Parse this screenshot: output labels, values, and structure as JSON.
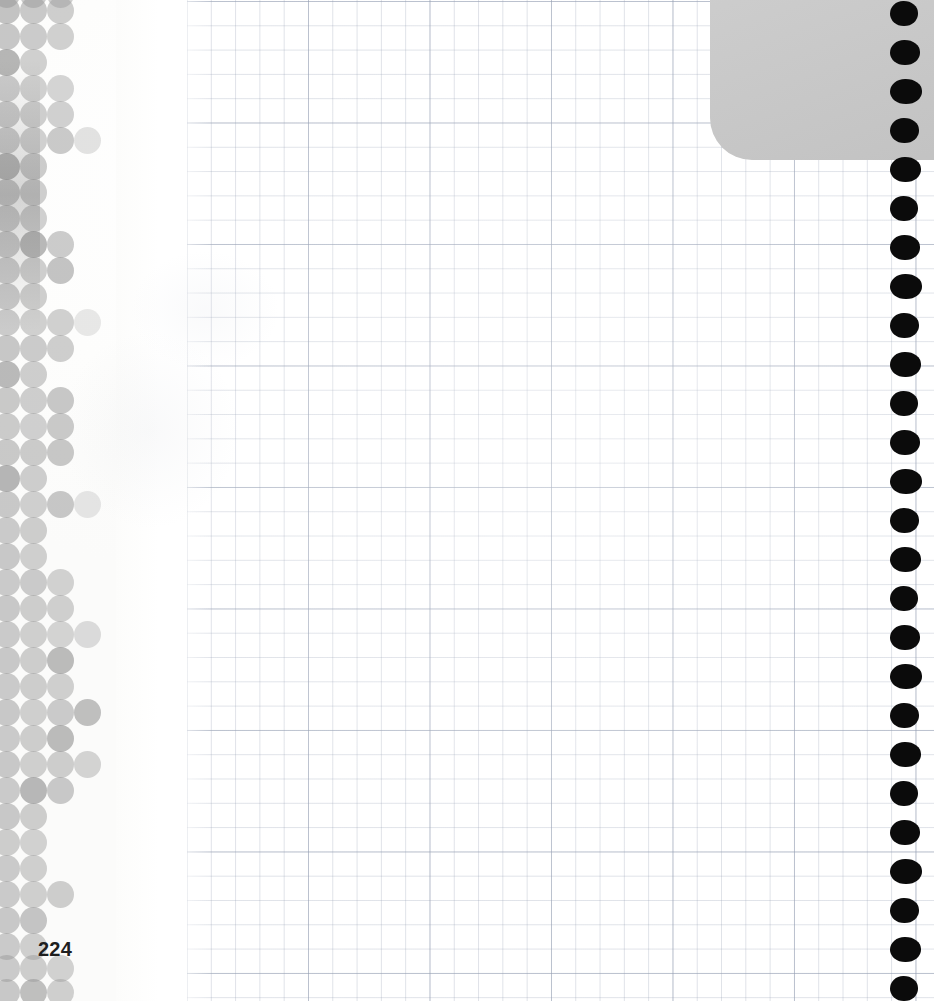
{
  "page": {
    "type": "scanned-book-page",
    "page_number": "224",
    "page_number_color": "#1f1f1f",
    "paper": {
      "kind": "graph-paper",
      "background_color": "#ffffff",
      "minor_grid_color": "#96a0b4",
      "major_grid_color": "#96a0b4",
      "minor_cell_px": 24,
      "major_cell_px": 121,
      "grid_left_px": 186,
      "grid_right_px": 934
    },
    "content_text": ""
  },
  "gray_panel": {
    "label": "top-right gray block",
    "color": "#c9c9c9",
    "left_px": 710,
    "top_px": 0,
    "width_px": 224,
    "height_px": 160,
    "corner_radius_px": 42
  },
  "binding": {
    "label": "right edge binding holes",
    "color": "#0b0b0b",
    "count": 26,
    "first_center_y_px": 14,
    "spacing_px": 39,
    "center_x_px": 905,
    "diameter_px": 28
  },
  "halftone": {
    "label": "left margin halftone dot pattern",
    "base_color": "#9a9a9a",
    "columns_x_px": [
      6,
      33,
      60,
      87,
      113
    ],
    "row_spacing_px": 26,
    "dot_diameter_px": 27,
    "rows": [
      {
        "y": -6,
        "cells": [
          {
            "c": 0,
            "o": 0.55
          },
          {
            "c": 1,
            "o": 0.5
          },
          {
            "c": 2,
            "o": 0.45
          }
        ]
      },
      {
        "y": 10,
        "cells": [
          {
            "c": 0,
            "o": 0.58
          },
          {
            "c": 1,
            "o": 0.52
          },
          {
            "c": 2,
            "o": 0.48
          }
        ]
      },
      {
        "y": 36,
        "cells": [
          {
            "c": 0,
            "o": 0.55
          },
          {
            "c": 1,
            "o": 0.5
          },
          {
            "c": 2,
            "o": 0.46
          }
        ]
      },
      {
        "y": 62,
        "cells": [
          {
            "c": 0,
            "o": 0.72
          },
          {
            "c": 1,
            "o": 0.46
          }
        ]
      },
      {
        "y": 88,
        "cells": [
          {
            "c": 0,
            "o": 0.5
          },
          {
            "c": 1,
            "o": 0.46
          },
          {
            "c": 2,
            "o": 0.42
          }
        ]
      },
      {
        "y": 114,
        "cells": [
          {
            "c": 0,
            "o": 0.52
          },
          {
            "c": 1,
            "o": 0.48
          },
          {
            "c": 2,
            "o": 0.45
          }
        ]
      },
      {
        "y": 140,
        "cells": [
          {
            "c": 0,
            "o": 0.5
          },
          {
            "c": 1,
            "o": 0.46
          },
          {
            "c": 2,
            "o": 0.52
          },
          {
            "c": 3,
            "o": 0.28
          }
        ]
      },
      {
        "y": 166,
        "cells": [
          {
            "c": 0,
            "o": 0.7
          },
          {
            "c": 1,
            "o": 0.5
          }
        ]
      },
      {
        "y": 192,
        "cells": [
          {
            "c": 0,
            "o": 0.52
          },
          {
            "c": 1,
            "o": 0.48
          }
        ]
      },
      {
        "y": 218,
        "cells": [
          {
            "c": 0,
            "o": 0.5
          },
          {
            "c": 1,
            "o": 0.46
          }
        ]
      },
      {
        "y": 244,
        "cells": [
          {
            "c": 0,
            "o": 0.52
          },
          {
            "c": 1,
            "o": 0.7
          },
          {
            "c": 2,
            "o": 0.5
          }
        ]
      },
      {
        "y": 270,
        "cells": [
          {
            "c": 0,
            "o": 0.5
          },
          {
            "c": 1,
            "o": 0.48
          },
          {
            "c": 2,
            "o": 0.58
          }
        ]
      },
      {
        "y": 296,
        "cells": [
          {
            "c": 0,
            "o": 0.52
          },
          {
            "c": 1,
            "o": 0.48
          }
        ]
      },
      {
        "y": 322,
        "cells": [
          {
            "c": 0,
            "o": 0.5
          },
          {
            "c": 1,
            "o": 0.46
          },
          {
            "c": 2,
            "o": 0.46
          },
          {
            "c": 3,
            "o": 0.22
          }
        ]
      },
      {
        "y": 348,
        "cells": [
          {
            "c": 0,
            "o": 0.54
          },
          {
            "c": 1,
            "o": 0.5
          },
          {
            "c": 2,
            "o": 0.48
          }
        ]
      },
      {
        "y": 374,
        "cells": [
          {
            "c": 0,
            "o": 0.68
          },
          {
            "c": 1,
            "o": 0.48
          }
        ]
      },
      {
        "y": 400,
        "cells": [
          {
            "c": 0,
            "o": 0.52
          },
          {
            "c": 1,
            "o": 0.48
          },
          {
            "c": 2,
            "o": 0.55
          }
        ]
      },
      {
        "y": 426,
        "cells": [
          {
            "c": 0,
            "o": 0.5
          },
          {
            "c": 1,
            "o": 0.46
          },
          {
            "c": 2,
            "o": 0.52
          }
        ]
      },
      {
        "y": 452,
        "cells": [
          {
            "c": 0,
            "o": 0.52
          },
          {
            "c": 1,
            "o": 0.5
          },
          {
            "c": 2,
            "o": 0.54
          }
        ]
      },
      {
        "y": 478,
        "cells": [
          {
            "c": 0,
            "o": 0.72
          },
          {
            "c": 1,
            "o": 0.48
          }
        ]
      },
      {
        "y": 504,
        "cells": [
          {
            "c": 0,
            "o": 0.52
          },
          {
            "c": 1,
            "o": 0.46
          },
          {
            "c": 2,
            "o": 0.54
          },
          {
            "c": 3,
            "o": 0.24
          }
        ]
      },
      {
        "y": 530,
        "cells": [
          {
            "c": 0,
            "o": 0.5
          },
          {
            "c": 1,
            "o": 0.48
          }
        ]
      },
      {
        "y": 556,
        "cells": [
          {
            "c": 0,
            "o": 0.52
          },
          {
            "c": 1,
            "o": 0.46
          }
        ]
      },
      {
        "y": 582,
        "cells": [
          {
            "c": 0,
            "o": 0.5
          },
          {
            "c": 1,
            "o": 0.5
          },
          {
            "c": 2,
            "o": 0.44
          }
        ]
      },
      {
        "y": 608,
        "cells": [
          {
            "c": 0,
            "o": 0.52
          },
          {
            "c": 1,
            "o": 0.48
          },
          {
            "c": 2,
            "o": 0.46
          }
        ]
      },
      {
        "y": 634,
        "cells": [
          {
            "c": 0,
            "o": 0.5
          },
          {
            "c": 1,
            "o": 0.46
          },
          {
            "c": 2,
            "o": 0.42
          },
          {
            "c": 3,
            "o": 0.34
          }
        ]
      },
      {
        "y": 660,
        "cells": [
          {
            "c": 0,
            "o": 0.52
          },
          {
            "c": 1,
            "o": 0.48
          },
          {
            "c": 2,
            "o": 0.66
          }
        ]
      },
      {
        "y": 686,
        "cells": [
          {
            "c": 0,
            "o": 0.5
          },
          {
            "c": 1,
            "o": 0.48
          },
          {
            "c": 2,
            "o": 0.46
          }
        ]
      },
      {
        "y": 712,
        "cells": [
          {
            "c": 0,
            "o": 0.52
          },
          {
            "c": 1,
            "o": 0.46
          },
          {
            "c": 2,
            "o": 0.5
          },
          {
            "c": 3,
            "o": 0.62
          }
        ]
      },
      {
        "y": 738,
        "cells": [
          {
            "c": 0,
            "o": 0.5
          },
          {
            "c": 1,
            "o": 0.48
          },
          {
            "c": 2,
            "o": 0.66
          }
        ]
      },
      {
        "y": 764,
        "cells": [
          {
            "c": 0,
            "o": 0.52
          },
          {
            "c": 1,
            "o": 0.46
          },
          {
            "c": 2,
            "o": 0.48
          },
          {
            "c": 3,
            "o": 0.42
          }
        ]
      },
      {
        "y": 790,
        "cells": [
          {
            "c": 0,
            "o": 0.5
          },
          {
            "c": 1,
            "o": 0.7
          },
          {
            "c": 2,
            "o": 0.52
          }
        ]
      },
      {
        "y": 816,
        "cells": [
          {
            "c": 0,
            "o": 0.52
          },
          {
            "c": 1,
            "o": 0.48
          }
        ]
      },
      {
        "y": 842,
        "cells": [
          {
            "c": 0,
            "o": 0.48
          },
          {
            "c": 1,
            "o": 0.44
          }
        ]
      },
      {
        "y": 868,
        "cells": [
          {
            "c": 0,
            "o": 0.5
          },
          {
            "c": 1,
            "o": 0.46
          }
        ]
      },
      {
        "y": 894,
        "cells": [
          {
            "c": 0,
            "o": 0.5
          },
          {
            "c": 1,
            "o": 0.46
          },
          {
            "c": 2,
            "o": 0.48
          }
        ]
      },
      {
        "y": 920,
        "cells": [
          {
            "c": 0,
            "o": 0.52
          },
          {
            "c": 1,
            "o": 0.56
          }
        ]
      },
      {
        "y": 946,
        "cells": [
          {
            "c": 0,
            "o": 0.5
          },
          {
            "c": 1,
            "o": 0.46
          }
        ]
      },
      {
        "y": 968,
        "cells": [
          {
            "c": 0,
            "o": 0.5
          },
          {
            "c": 1,
            "o": 0.48
          },
          {
            "c": 2,
            "o": 0.44
          }
        ]
      },
      {
        "y": 992,
        "cells": [
          {
            "c": 0,
            "o": 0.52
          },
          {
            "c": 1,
            "o": 0.62
          },
          {
            "c": 2,
            "o": 0.46
          }
        ]
      }
    ]
  }
}
